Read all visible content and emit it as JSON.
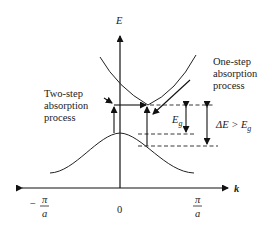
{
  "diagram": {
    "axes": {
      "y_label": "E",
      "x_label": "k",
      "x_ticks": [
        {
          "label_num": "π",
          "label_den": "a",
          "sign": "−",
          "position": "-pi/a"
        },
        {
          "label": "0",
          "position": "0"
        },
        {
          "label_num": "π",
          "label_den": "a",
          "sign": "",
          "position": "pi/a"
        }
      ]
    },
    "bands": {
      "conduction_band": "parabola with minimum displaced from k=0",
      "valence_band": "cosine-like band with maximum at k=0"
    },
    "annotations": {
      "two_step": [
        "Two-step",
        "absorption",
        "process"
      ],
      "one_step": [
        "One-step",
        "absorption",
        "process"
      ],
      "band_gap": {
        "symbol": "E",
        "subscript": "g"
      },
      "delta_e": {
        "text": "ΔE > E",
        "subscript": "g"
      }
    }
  }
}
